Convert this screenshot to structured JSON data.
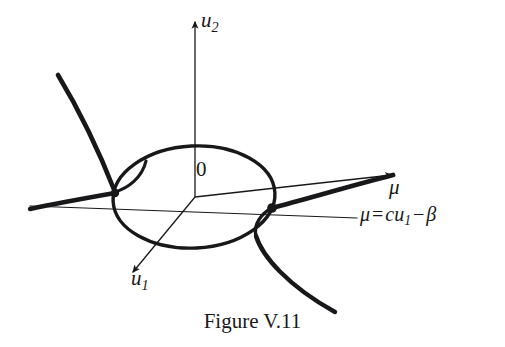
{
  "figure": {
    "caption": "Figure V.11",
    "background_color": "#ffffff",
    "ink_color": "#18181a",
    "width": 505,
    "height": 347
  },
  "axes": [
    {
      "id": "u2",
      "name": "u2-axis",
      "label_base": "u",
      "label_sub": "2",
      "direction": "up",
      "origin": [
        195,
        197
      ],
      "tip": [
        195,
        17
      ],
      "arrowhead": true,
      "stroke_width": 1.3
    },
    {
      "id": "u1",
      "name": "u1-axis",
      "label_base": "u",
      "label_sub": "1",
      "direction": "down-left",
      "origin": [
        195,
        197
      ],
      "tip": [
        128,
        278
      ],
      "arrowhead": true,
      "stroke_width": 1.3
    },
    {
      "id": "mu",
      "name": "mu-axis",
      "label_base": "μ",
      "label_sub": "",
      "direction": "right-up",
      "origin": [
        195,
        197
      ],
      "tip": [
        398,
        174
      ],
      "arrowhead": true,
      "stroke_width": 1.3
    }
  ],
  "labels": {
    "origin": "0",
    "u2": {
      "base": "u",
      "sub": "2"
    },
    "u1": {
      "base": "u",
      "sub": "1"
    },
    "mu": "μ",
    "equation": {
      "lhs": "μ",
      "equals": "=",
      "coef": "c",
      "var_base": "u",
      "var_sub": "1",
      "minus": "−",
      "rhs": "β",
      "full": "μ = cu₁ − β"
    }
  },
  "geometry": {
    "ellipse": {
      "name": "equilibrium-ellipse",
      "center": [
        194,
        197
      ],
      "rx": 81,
      "ry": 51,
      "rotation_deg": -3,
      "stroke_width": 3.4
    },
    "nodes": [
      {
        "name": "left-intersection-node",
        "x": 115,
        "y": 193,
        "r": 4.2
      },
      {
        "name": "right-intersection-node",
        "x": 272,
        "y": 208,
        "r": 4.6
      }
    ],
    "constraint_line": {
      "name": "constraint-line-mu-cu1-beta",
      "from": [
        30,
        209
      ],
      "to": [
        357,
        217
      ],
      "stroke_width": 1.3
    },
    "branches": [
      {
        "name": "upper-left-branch",
        "from": [
          58,
          75
        ],
        "to": [
          115,
          193
        ]
      },
      {
        "name": "lower-left-branch",
        "from": [
          30,
          208
        ],
        "to": [
          115,
          193
        ]
      },
      {
        "name": "upper-right-branch",
        "from": [
          272,
          208
        ],
        "to": [
          393,
          175
        ]
      },
      {
        "name": "lower-right-branch",
        "from": [
          272,
          208
        ],
        "to": [
          335,
          312
        ]
      },
      {
        "name": "left-cusp-loop",
        "from": [
          115,
          193
        ],
        "to": [
          146,
          162
        ]
      },
      {
        "name": "right-cusp-loop",
        "from": [
          272,
          208
        ],
        "to": [
          256,
          236
        ]
      }
    ]
  }
}
